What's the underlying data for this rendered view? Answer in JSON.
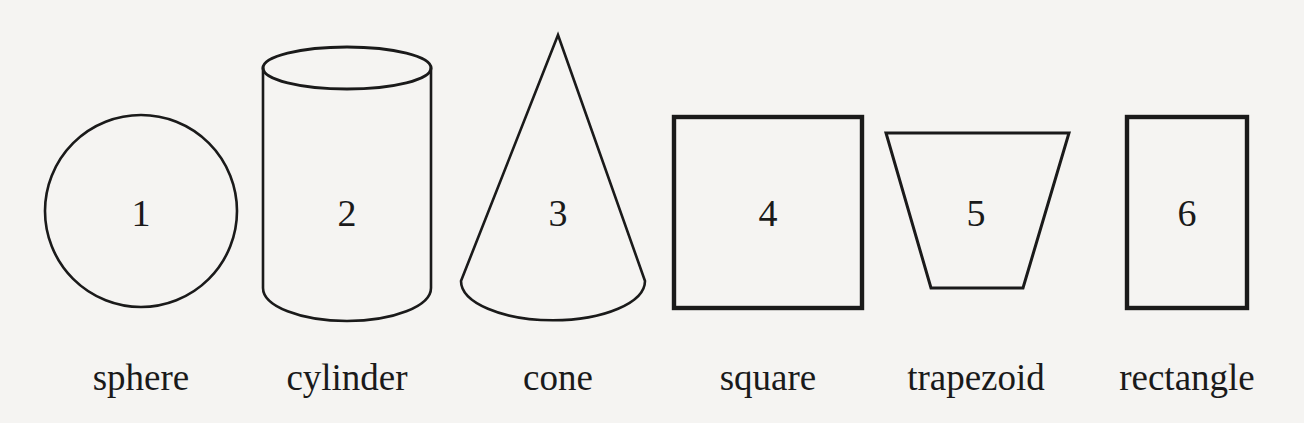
{
  "page": {
    "background_color": "#f5f4f2",
    "ink_color": "#1a1a1a",
    "width": 1304,
    "height": 423
  },
  "figures": [
    {
      "number": "1",
      "caption": "sphere",
      "icon": "circle-outline-icon",
      "number_x": 141,
      "number_y": 226,
      "caption_x": 141,
      "caption_y": 390
    },
    {
      "number": "2",
      "caption": "cylinder",
      "icon": "cylinder-outline-icon",
      "number_x": 347,
      "number_y": 226,
      "caption_x": 347,
      "caption_y": 390
    },
    {
      "number": "3",
      "caption": "cone",
      "icon": "cone-outline-icon",
      "number_x": 558,
      "number_y": 226,
      "caption_x": 558,
      "caption_y": 390
    },
    {
      "number": "4",
      "caption": "square",
      "icon": "square-outline-icon",
      "number_x": 768,
      "number_y": 226,
      "caption_x": 768,
      "caption_y": 390
    },
    {
      "number": "5",
      "caption": "trapezoid",
      "icon": "trapezoid-outline-icon",
      "number_x": 976,
      "number_y": 226,
      "caption_x": 976,
      "caption_y": 390
    },
    {
      "number": "6",
      "caption": "rectangle",
      "icon": "rectangle-outline-icon",
      "number_x": 1187,
      "number_y": 226,
      "caption_x": 1187,
      "caption_y": 390
    }
  ]
}
